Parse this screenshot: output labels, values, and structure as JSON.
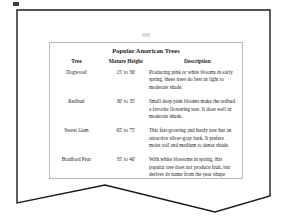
{
  "page": {
    "title": "Popular American Trees",
    "border_color": "#1a1a1a",
    "table_border_color": "#b9b9b9",
    "text_color": "#1c1c1c",
    "background": "#ffffff"
  },
  "table": {
    "title": "Popular American Trees",
    "columns": [
      "Tree",
      "Mature Height",
      "Description"
    ],
    "rows": [
      {
        "tree": "Dogwood",
        "height": "15' to 30'",
        "description": "Producing pink or white blooms in early spring, these trees do best in light to moderate shade."
      },
      {
        "tree": "Redbud",
        "height": "30' to 35'",
        "description": "Small deep pink blooms make the redbud a favorite flowering tree.  It does well in moderate shade."
      },
      {
        "tree": "Sweet Gum",
        "height": "65' to 75'",
        "description": "This fast-growing and hardy tree has an attractive silver-gray bark.  It prefers moist soil and medium to dense shade."
      },
      {
        "tree": "Bradford Pear",
        "height": "35' to 40'",
        "description": "With white blossoms in spring, this popular tree does not produce fruit, but derives its name from the pear shape formed by its branches."
      }
    ]
  },
  "artifacts": {
    "top_mark": "scan-smudge-mark",
    "faint_mark": "faint-scan-mark"
  }
}
